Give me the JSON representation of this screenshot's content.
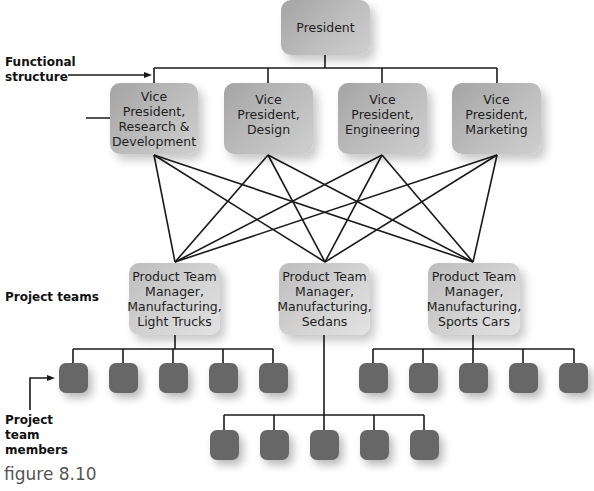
{
  "diagram": {
    "president": {
      "label": "President"
    },
    "vice_presidents": [
      {
        "label": "Vice\nPresident,\nResearch &\nDevelopment"
      },
      {
        "label": "Vice\nPresident,\nDesign"
      },
      {
        "label": "Vice\nPresident,\nEngineering"
      },
      {
        "label": "Vice\nPresident,\nMarketing"
      }
    ],
    "project_teams": [
      {
        "label": "Product Team\nManager,\nManufacturing,\nLight Trucks",
        "member_count": 5
      },
      {
        "label": "Product Team\nManager,\nManufacturing,\nSedans",
        "member_count": 5
      },
      {
        "label": "Product Team\nManager,\nManufacturing,\nSports Cars",
        "member_count": 5
      }
    ],
    "annotations": {
      "functional_structure": "Functional\nstructure",
      "project_teams": "Project teams",
      "project_team_members": "Project\nteam\nmembers"
    },
    "caption": "figure 8.10",
    "colors": {
      "line": "#1a1a1a",
      "exec_box": "#b4b4b4",
      "team_box": "#cfcfcf",
      "member_box": "#676767"
    }
  }
}
